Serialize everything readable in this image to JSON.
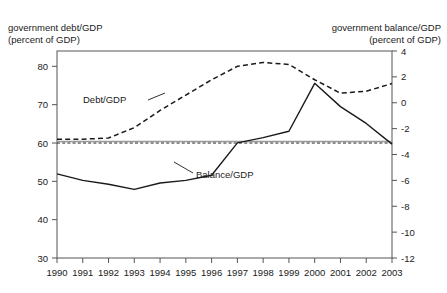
{
  "clipped_title": "",
  "header": {
    "left_label_line1": "government debt/GDP",
    "left_label_line2": "(percent of GDP)",
    "right_label_line1": "government balance/GDP",
    "right_label_line2": "(percent of GDP)"
  },
  "colors": {
    "line": "#1a1a1a",
    "axis": "#555555",
    "reference_gray": "#9a9a9a",
    "background": "#ffffff"
  },
  "chart_data": {
    "type": "line",
    "title": "",
    "xlabel": "",
    "ylabel": "",
    "grid": false,
    "legend": "inline-annotations",
    "x": [
      1990,
      1991,
      1992,
      1993,
      1994,
      1995,
      1996,
      1997,
      1998,
      1999,
      2000,
      2001,
      2002,
      2003
    ],
    "xtick_labels": [
      "1990",
      "1991",
      "1992",
      "1993",
      "1994",
      "1995",
      "1996",
      "1997",
      "1998",
      "1999",
      "2000",
      "2001",
      "2002",
      "2003"
    ],
    "left_axis": {
      "label_line1": "government debt/GDP",
      "label_line2": "(percent of GDP)",
      "ylim": [
        30,
        84
      ],
      "ticks": [
        30,
        40,
        50,
        60,
        70,
        80
      ],
      "tick_labels": [
        "30",
        "40",
        "50",
        "60",
        "70",
        "80"
      ]
    },
    "right_axis": {
      "label_line1": "government balance/GDP",
      "label_line2": "(percent of GDP)",
      "ylim": [
        -12,
        4
      ],
      "ticks": [
        4,
        2,
        0,
        -2,
        -4,
        -6,
        -8,
        -10,
        -12
      ],
      "tick_labels": [
        "4",
        "2",
        "0",
        "-2",
        "-4",
        "-6",
        "-8",
        "-10",
        "-12"
      ]
    },
    "series": [
      {
        "name": "Debt/GDP",
        "annotation": "Debt/GDP",
        "axis": "left",
        "style": "dashed",
        "values": [
          61.0,
          61.0,
          61.3,
          64.0,
          68.5,
          72.5,
          76.5,
          80.0,
          81.0,
          80.5,
          76.5,
          73.0,
          73.5,
          75.5
        ]
      },
      {
        "name": "Balance/GDP",
        "annotation": "Balance/GDP",
        "axis": "right",
        "style": "solid",
        "values": [
          -5.5,
          -6.0,
          -6.3,
          -6.7,
          -6.2,
          -6.0,
          -5.6,
          -3.1,
          -2.7,
          -2.2,
          1.5,
          -0.3,
          -1.6,
          -3.2
        ]
      }
    ],
    "reference_lines": [
      {
        "name": "debt-reference-60",
        "axis": "left",
        "value": 60.0,
        "style": "dashed",
        "color": "#1a1a1a"
      },
      {
        "name": "balance-reference-minus3",
        "axis": "right",
        "value": -3.0,
        "style": "solid",
        "color": "#9a9a9a"
      }
    ]
  }
}
